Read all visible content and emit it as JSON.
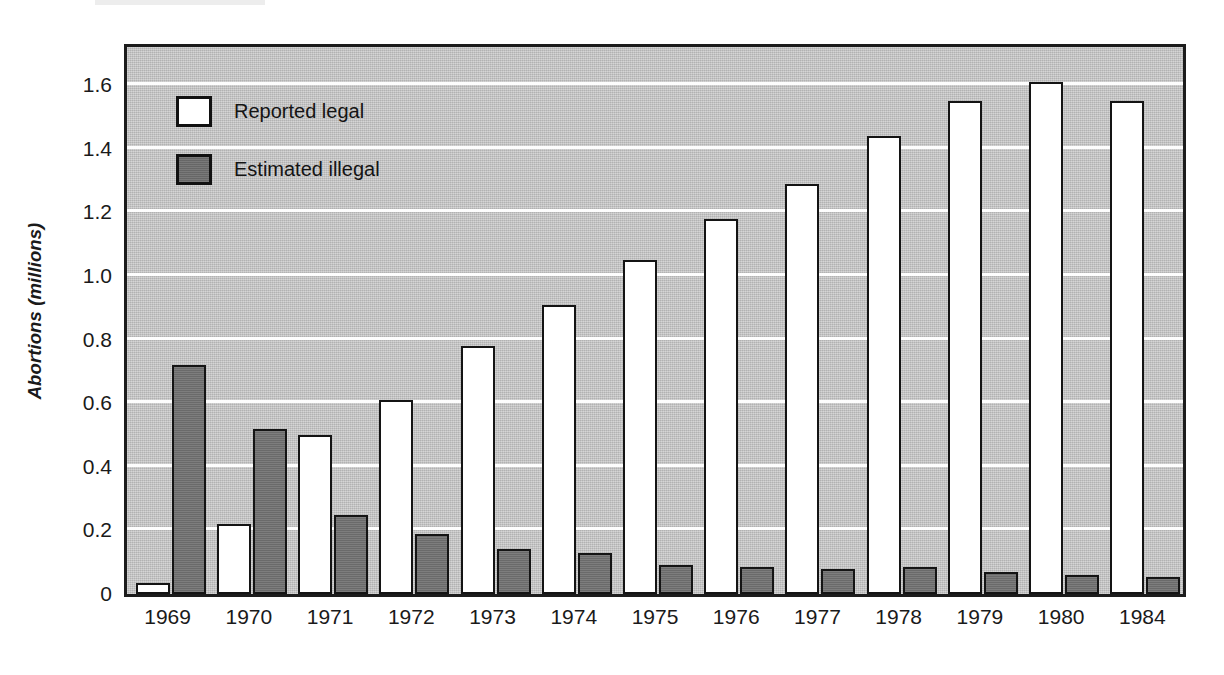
{
  "chart_data": {
    "type": "bar",
    "title": "",
    "xlabel": "",
    "ylabel": "Abortions (millions)",
    "categories": [
      "1969",
      "1970",
      "1971",
      "1972",
      "1973",
      "1974",
      "1975",
      "1976",
      "1977",
      "1978",
      "1979",
      "1980",
      "1984"
    ],
    "series": [
      {
        "name": "Reported legal",
        "color": "#ffffff",
        "values": [
          0.035,
          0.22,
          0.5,
          0.61,
          0.78,
          0.91,
          1.05,
          1.18,
          1.29,
          1.44,
          1.55,
          1.61,
          1.55
        ]
      },
      {
        "name": "Estimated illegal",
        "color": "#737373",
        "values": [
          0.72,
          0.52,
          0.25,
          0.19,
          0.14,
          0.13,
          0.09,
          0.085,
          0.08,
          0.085,
          0.07,
          0.06,
          0.055
        ]
      }
    ],
    "ylim": [
      0,
      1.72
    ],
    "yticks": [
      0,
      0.2,
      0.4,
      0.6,
      0.8,
      1.0,
      1.2,
      1.4,
      1.6
    ],
    "ytick_labels": [
      "0",
      "0.2",
      "0.4",
      "0.6",
      "0.8",
      "1.0",
      "1.2",
      "1.4",
      "1.6"
    ],
    "grid": true,
    "grid_color": "#fdfdfd",
    "legend_position": "top-left",
    "plot_background": "#c6c6c6",
    "axis_color": "#1c1c1c"
  },
  "legend": {
    "items": [
      {
        "label": "Reported legal",
        "swatch": "legal"
      },
      {
        "label": "Estimated illegal",
        "swatch": "illegal"
      }
    ]
  }
}
